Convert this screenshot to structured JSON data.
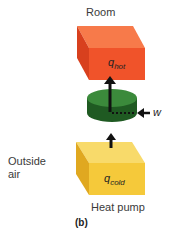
{
  "diagram": {
    "hot_reservoir": {
      "label": "Room",
      "quantity": "q",
      "quantity_sub": "hot",
      "color": "#f0532a"
    },
    "engine": {
      "color": "#2e6e2e",
      "work_label": "w"
    },
    "cold_reservoir": {
      "label_line1": "Outside",
      "label_line2": "air",
      "quantity": "q",
      "quantity_sub": "cold",
      "color": "#f5c93a"
    },
    "device_label": "Heat pump",
    "caption": "(b)"
  }
}
